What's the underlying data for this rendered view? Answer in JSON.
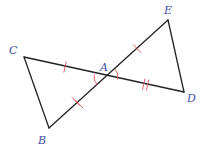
{
  "diagram": {
    "type": "geometry",
    "colors": {
      "line": "#222222",
      "marks": "#d9545e",
      "labels": "#3b4ea8"
    },
    "points": {
      "A": {
        "label": "A",
        "x": 106,
        "y": 77
      },
      "B": {
        "label": "B",
        "x": 49,
        "y": 128
      },
      "C": {
        "label": "C",
        "x": 24,
        "y": 57
      },
      "D": {
        "label": "D",
        "x": 184,
        "y": 92
      },
      "E": {
        "label": "E",
        "x": 168,
        "y": 20
      }
    },
    "segments": [
      "CD",
      "BE",
      "CB",
      "ED"
    ],
    "congruence_marks": [
      {
        "segment": "CA",
        "ticks": 1
      },
      {
        "segment": "AE",
        "ticks": 1
      },
      {
        "segment": "AB",
        "ticks": 2
      },
      {
        "segment": "AD",
        "ticks": 2
      }
    ],
    "angle_marks": [
      {
        "angle": "CAB",
        "arcs": 1
      },
      {
        "angle": "EAD",
        "arcs": 1
      }
    ]
  }
}
